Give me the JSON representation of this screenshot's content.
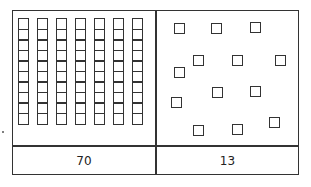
{
  "tens": {
    "rods": 7,
    "cells_per_rod": 10,
    "value_label": "70"
  },
  "ones": {
    "units": 13,
    "value_label": "13",
    "positions": [
      [
        174,
        23
      ],
      [
        211,
        23
      ],
      [
        250,
        22
      ],
      [
        193,
        55
      ],
      [
        232,
        55
      ],
      [
        275,
        55
      ],
      [
        174,
        67
      ],
      [
        212,
        87
      ],
      [
        250,
        86
      ],
      [
        171,
        97
      ],
      [
        269,
        117
      ],
      [
        193,
        125
      ],
      [
        232,
        124
      ]
    ]
  },
  "colors": {
    "stroke": "#333333",
    "background": "#ffffff"
  }
}
